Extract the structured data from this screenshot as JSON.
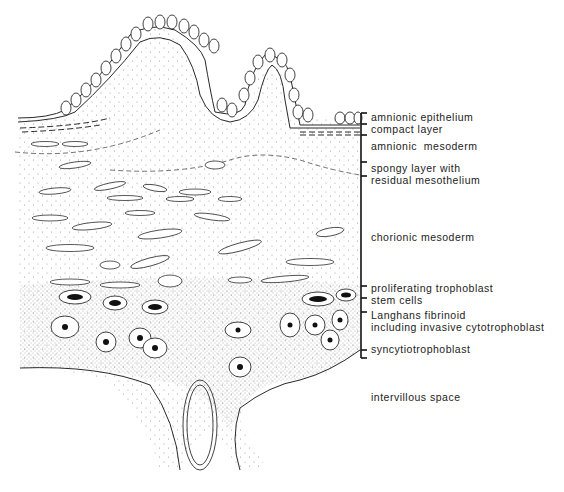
{
  "figure": {
    "type": "histological schematic",
    "labels": [
      {
        "id": "amnionic-epithelium",
        "text": "amnionic epithelium",
        "y": 117
      },
      {
        "id": "compact-layer",
        "text": "compact layer",
        "y": 129
      },
      {
        "id": "amnionic-mesoderm",
        "text": "amnionic  mesoderm",
        "y": 146
      },
      {
        "id": "spongy-layer",
        "text": "spongy layer with\nresidual mesothelium",
        "y": 168
      },
      {
        "id": "chorionic-mesoderm",
        "text": "chorionic mesoderm",
        "y": 237
      },
      {
        "id": "proliferating-trophoblast",
        "text": "proliferating trophoblast\nstem cells",
        "y": 288
      },
      {
        "id": "langhans-fibrinoid",
        "text": "Langhans fibrinoid\nincluding invasive cytotrophoblast",
        "y": 315
      },
      {
        "id": "syncytiotrophoblast",
        "text": "syncytiotrophoblast",
        "y": 349
      },
      {
        "id": "intervillous-space",
        "text": "intervillous space",
        "y": 396
      }
    ],
    "bracket": {
      "x": 361,
      "top": 113,
      "bottom": 358,
      "ticks": [
        113,
        124,
        135,
        162,
        176,
        286,
        298,
        312,
        350,
        358
      ]
    }
  }
}
